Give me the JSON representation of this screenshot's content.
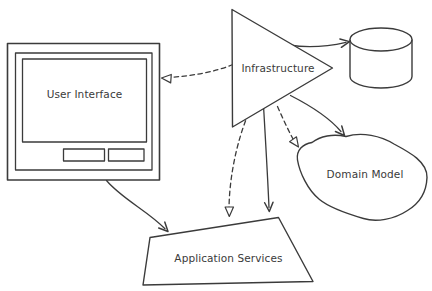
{
  "diagram": {
    "background_color": "#ffffff",
    "line_color": "#3b3b3b",
    "nodes": {
      "user_interface": {
        "label": "User Interface",
        "shape": "monitor"
      },
      "infrastructure": {
        "label": "Infrastructure",
        "shape": "triangle"
      },
      "database": {
        "shape": "cylinder"
      },
      "domain_model": {
        "label": "Domain Model",
        "shape": "blob"
      },
      "application_services": {
        "label": "Application Services",
        "shape": "trapezoid"
      }
    },
    "edges": [
      {
        "from": "infrastructure",
        "to": "user_interface",
        "line": "dashed",
        "arrowhead": "open"
      },
      {
        "from": "infrastructure",
        "to": "database",
        "line": "solid",
        "arrowhead": "barb"
      },
      {
        "from": "user_interface",
        "to": "application_services",
        "line": "solid",
        "arrowhead": "barb"
      },
      {
        "from": "infrastructure",
        "to": "application_services",
        "line": "dashed",
        "arrowhead": "open"
      },
      {
        "from": "infrastructure",
        "to": "application_services",
        "line": "solid",
        "arrowhead": "barb"
      },
      {
        "from": "infrastructure",
        "to": "domain_model",
        "line": "dashed",
        "arrowhead": "open"
      },
      {
        "from": "infrastructure",
        "to": "domain_model",
        "line": "solid",
        "arrowhead": "barb"
      }
    ]
  }
}
